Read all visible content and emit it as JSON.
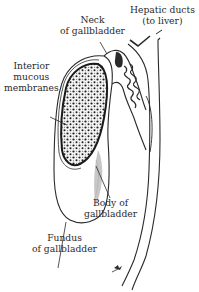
{
  "diagram": {
    "type": "anatomical-illustration",
    "subject": "gallbladder",
    "colors": {
      "background": "#ffffff",
      "ink": "#2a2a2a",
      "stipple": "#1e1e1e"
    },
    "labels": {
      "hepatic_ducts": {
        "line1": "Hepatic ducts",
        "line2": "(to liver)"
      },
      "neck": {
        "line1": "Neck",
        "line2": "of gallbladder"
      },
      "interior_mucous": {
        "line1": "Interior",
        "line2": "mucous",
        "line3": "membranes"
      },
      "body": {
        "line1": "Body of",
        "line2": "gallbladder"
      },
      "fundus": {
        "line1": "Fundus",
        "line2": "of gallbladder"
      }
    }
  }
}
